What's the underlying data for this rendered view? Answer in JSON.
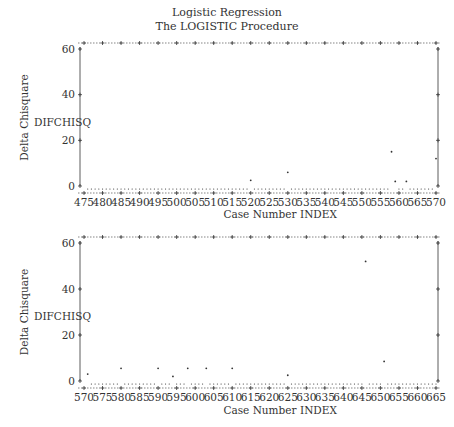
{
  "header": {
    "title": "Logistic Regression",
    "subtitle": "The LOGISTIC Procedure"
  },
  "chart_data": [
    {
      "type": "scatter",
      "title": "Logistic Regression — The LOGISTIC Procedure",
      "xlabel": "Case Number    INDEX",
      "ylabel": "Delta Chisquare",
      "yvar_label": "DIFCHISQ",
      "xlim": [
        475,
        570
      ],
      "ylim": [
        0,
        60
      ],
      "xticks": [
        475,
        480,
        485,
        490,
        495,
        500,
        505,
        510,
        515,
        520,
        525,
        530,
        535,
        540,
        545,
        550,
        555,
        560,
        565,
        570
      ],
      "yticks": [
        0,
        20,
        40,
        60
      ],
      "grid": false,
      "note": "Most cases plot as dots at approximately 0 (near-zero DIFCHISQ); notable points listed",
      "points": [
        {
          "x": 520,
          "y": 2.5
        },
        {
          "x": 530,
          "y": 6
        },
        {
          "x": 558,
          "y": 15
        },
        {
          "x": 559,
          "y": 2
        },
        {
          "x": 562,
          "y": 2
        },
        {
          "x": 570,
          "y": 12
        }
      ]
    },
    {
      "type": "scatter",
      "xlabel": "Case Number    INDEX",
      "ylabel": "Delta Chisquare",
      "yvar_label": "DIFCHISQ",
      "xlim": [
        570,
        665
      ],
      "ylim": [
        0,
        60
      ],
      "xticks": [
        570,
        575,
        580,
        585,
        590,
        595,
        600,
        605,
        610,
        615,
        620,
        625,
        630,
        635,
        640,
        645,
        650,
        655,
        660,
        665
      ],
      "yticks": [
        0,
        20,
        40,
        60
      ],
      "grid": false,
      "note": "Most cases plot as dots at approximately 0 (near-zero DIFCHISQ); notable points listed",
      "points": [
        {
          "x": 571,
          "y": 3
        },
        {
          "x": 580,
          "y": 5.5
        },
        {
          "x": 590,
          "y": 5.5
        },
        {
          "x": 594,
          "y": 2
        },
        {
          "x": 598,
          "y": 5.5
        },
        {
          "x": 603,
          "y": 5.5
        },
        {
          "x": 610,
          "y": 5.5
        },
        {
          "x": 625,
          "y": 2.5
        },
        {
          "x": 646,
          "y": 52
        },
        {
          "x": 651,
          "y": 8.5
        }
      ]
    }
  ],
  "labels": {
    "ylabel": "Delta Chisquare",
    "yvar": "DIFCHISQ",
    "xlabel": "Case Number",
    "xvar": "INDEX"
  },
  "colors": {
    "ink": "#333333",
    "background": "#ffffff"
  }
}
